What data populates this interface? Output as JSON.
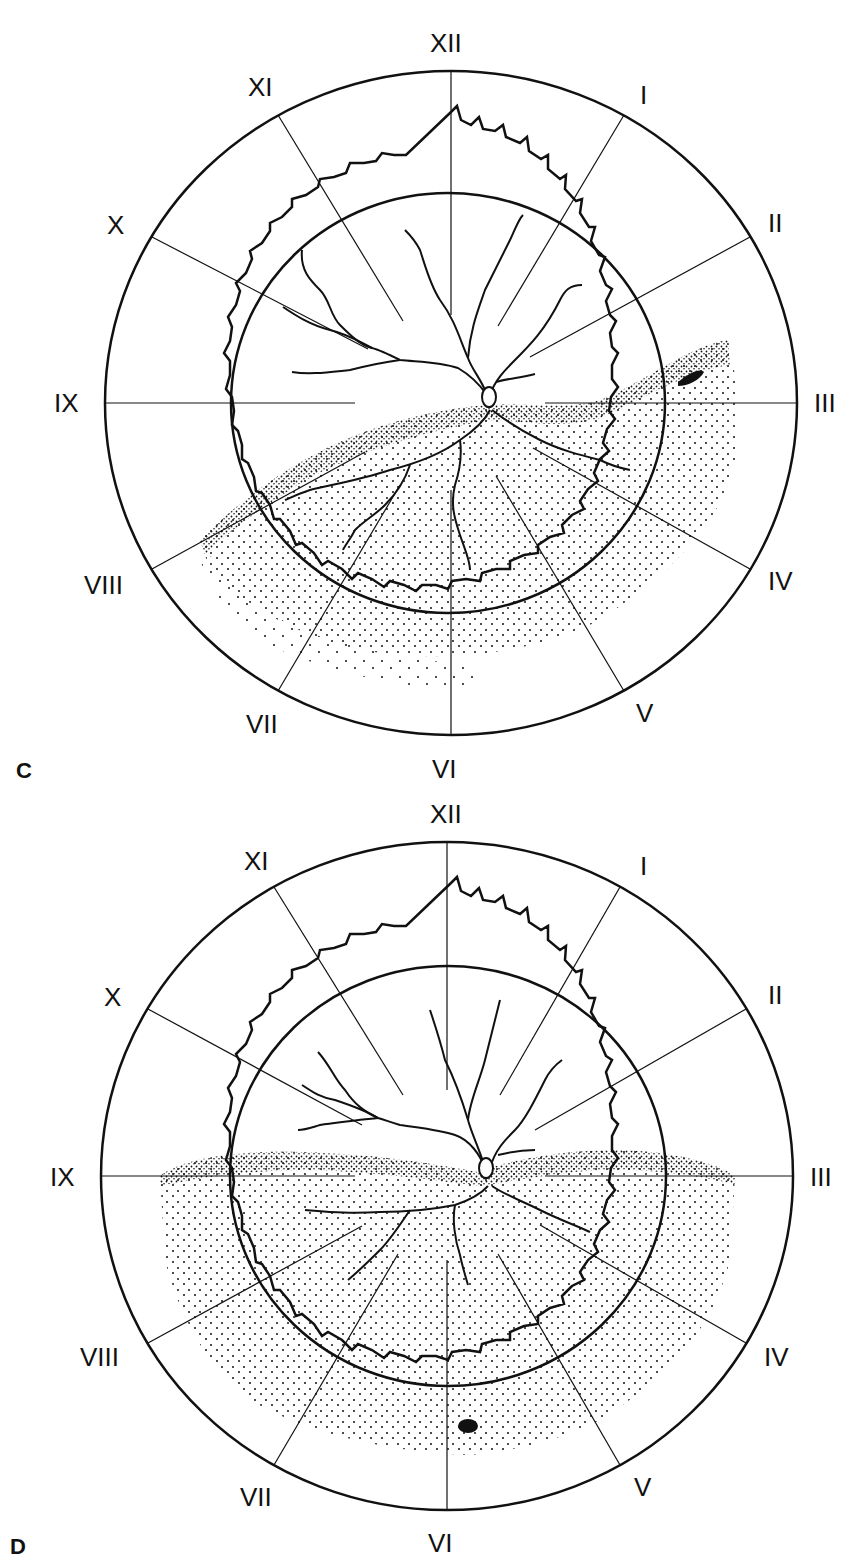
{
  "figure": {
    "panels": [
      {
        "id": "C",
        "label": "C",
        "clock_hours": [
          "XII",
          "I",
          "II",
          "III",
          "IV",
          "V",
          "VI",
          "VII",
          "VIII",
          "IX",
          "X",
          "XI"
        ],
        "description": "Fundus drawing: detached retina (stippled) inferiorly from ~VIII to ~III o'clock, with a horseshoe tear near III o'clock",
        "features": {
          "optic_disc": "center-right",
          "stippled_region": "inferior detachment sweeping from VIII to III",
          "retinal_break": "elongated black tear between II and III"
        }
      },
      {
        "id": "D",
        "label": "D",
        "clock_hours": [
          "XII",
          "I",
          "II",
          "III",
          "IV",
          "V",
          "VI",
          "VII",
          "VIII",
          "IX",
          "X",
          "XI"
        ],
        "description": "Fundus drawing: inferior detachment (stippled) from IX to III o'clock, with a small round hole near VI o'clock",
        "features": {
          "optic_disc": "center",
          "stippled_region": "inferior detachment from IX to III",
          "retinal_break": "small round hole near VI"
        }
      }
    ]
  },
  "colors": {
    "ink": "#111111",
    "background": "#ffffff"
  }
}
